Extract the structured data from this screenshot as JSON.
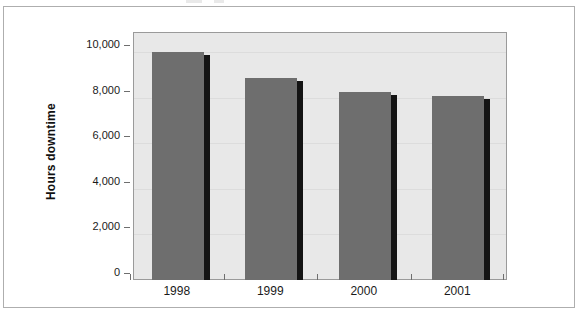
{
  "figure": {
    "background_color": "#ffffff",
    "frame_color": "#aeaeae",
    "plot_background_color": "#e8e8e8",
    "bar_color": "#6e6e6e",
    "bar_shadow_color": "#141414"
  },
  "chart_data": {
    "type": "bar",
    "title": "",
    "subtitle": "",
    "xlabel": "",
    "ylabel": "Hours downtime",
    "categories": [
      "1998",
      "1999",
      "2000",
      "2001"
    ],
    "values": [
      10000,
      8870,
      8260,
      8080
    ],
    "series": [
      {
        "name": "Hours downtime",
        "values": [
          10000,
          8870,
          8260,
          8080
        ]
      }
    ],
    "ylim": [
      0,
      10800
    ],
    "ytick_values": [
      0,
      2000,
      4000,
      6000,
      8000,
      10000
    ],
    "ytick_labels": [
      "0",
      "2,000",
      "4,000",
      "6,000",
      "8,000",
      "10,000"
    ],
    "grid": true,
    "legend": false,
    "legend_position": "none",
    "annotations": []
  }
}
